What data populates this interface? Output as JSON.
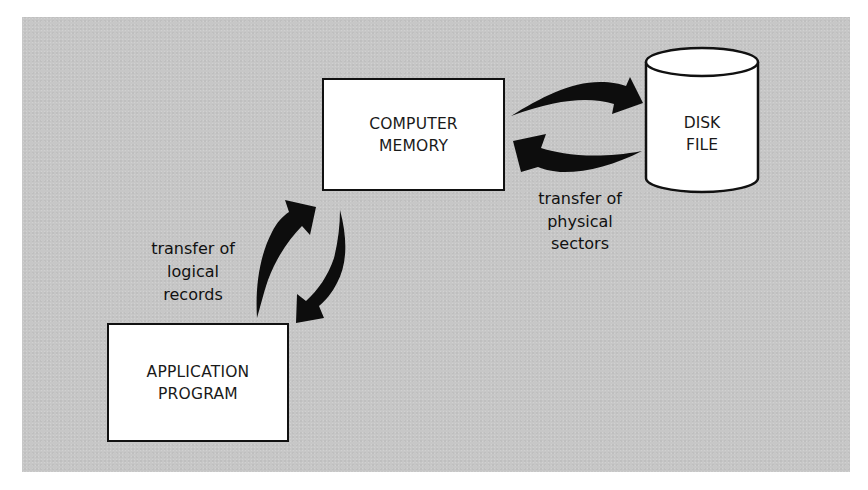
{
  "diagram": {
    "nodes": {
      "computer_memory": {
        "lines": [
          "COMPUTER",
          "MEMORY"
        ],
        "shape": "rectangle"
      },
      "disk_file": {
        "lines": [
          "DISK",
          "FILE"
        ],
        "shape": "cylinder"
      },
      "application_program": {
        "lines": [
          "APPLICATION",
          "PROGRAM"
        ],
        "shape": "rectangle"
      }
    },
    "edges": [
      {
        "from": "computer_memory",
        "to": "disk_file",
        "direction": "bidirectional",
        "label_lines": [
          "transfer of",
          "physical",
          "sectors"
        ]
      },
      {
        "from": "application_program",
        "to": "computer_memory",
        "direction": "bidirectional",
        "label_lines": [
          "transfer of",
          "logical",
          "records"
        ]
      }
    ]
  },
  "colors": {
    "panel_background": "#c7c7c7",
    "page_background": "#ffffff",
    "box_fill": "#ffffff",
    "stroke": "#111111",
    "arrow_fill": "#0d0d0d"
  }
}
